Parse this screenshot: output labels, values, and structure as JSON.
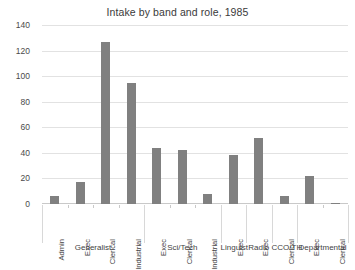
{
  "chart_data": {
    "type": "bar",
    "title": "Intake by band and role, 1985",
    "xlabel": "",
    "ylabel": "",
    "ylim": [
      0,
      140
    ],
    "yticks": [
      0,
      20,
      40,
      60,
      80,
      100,
      120,
      140
    ],
    "ytick_labels": [
      "0",
      "20",
      "40",
      "60",
      "80",
      "100",
      "120",
      "140"
    ],
    "grid": true,
    "legend": "none",
    "bar_color": "#808080",
    "categories": [
      "Admin",
      "Exec",
      "Clerical",
      "Industrial",
      "Exec",
      "Clerical",
      "Industrial",
      "Exec",
      "Exec",
      "Clerical",
      "Exec",
      "Clerical"
    ],
    "values": [
      6,
      17,
      127,
      95,
      44,
      42,
      8,
      38,
      52,
      6,
      22,
      1
    ],
    "groups": [
      {
        "label": "Generalist",
        "start": 0,
        "count": 4
      },
      {
        "label": "Sci/Tech",
        "start": 4,
        "count": 3
      },
      {
        "label": "Linguist",
        "start": 7,
        "count": 1
      },
      {
        "label": "Radio",
        "start": 8,
        "count": 1
      },
      {
        "label": "CCO/TH",
        "start": 9,
        "count": 1
      },
      {
        "label": "Departmental",
        "start": 10,
        "count": 2
      }
    ]
  }
}
